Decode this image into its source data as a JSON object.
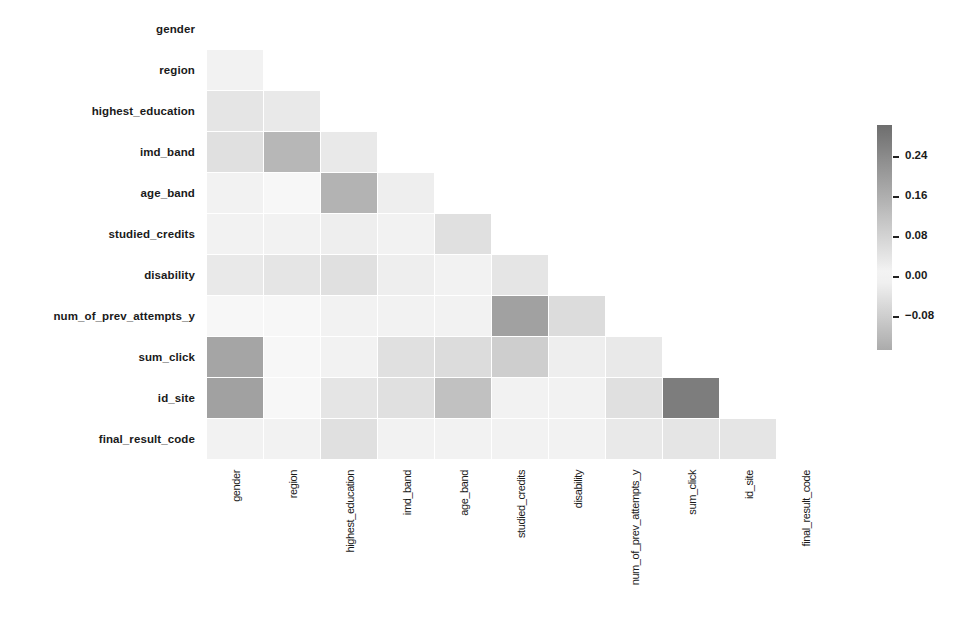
{
  "chart_data": {
    "type": "heatmap",
    "title": "",
    "subtitle": "",
    "variables": [
      "gender",
      "region",
      "highest_education",
      "imd_band",
      "age_band",
      "studied_credits",
      "disability",
      "num_of_prev_attempts_y",
      "sum_click",
      "id_site",
      "final_result_code"
    ],
    "row_labels": [
      "gender",
      "region",
      "highest_education",
      "imd_band",
      "age_band",
      "studied_credits",
      "disability",
      "num_of_prev_attempts_y",
      "sum_click",
      "id_site",
      "final_result_code"
    ],
    "col_labels": [
      "gender",
      "region",
      "highest_education",
      "imd_band",
      "age_band",
      "studied_credits",
      "disability",
      "num_of_prev_attempts_y",
      "sum_click",
      "id_site",
      "final_result_code"
    ],
    "mask": "upper triangle including diagonal hidden",
    "values": [
      [
        null,
        null,
        null,
        null,
        null,
        null,
        null,
        null,
        null,
        null,
        null
      ],
      [
        0.01,
        null,
        null,
        null,
        null,
        null,
        null,
        null,
        null,
        null,
        null
      ],
      [
        0.04,
        0.03,
        null,
        null,
        null,
        null,
        null,
        null,
        null,
        null,
        null
      ],
      [
        0.05,
        0.14,
        0.03,
        null,
        null,
        null,
        null,
        null,
        null,
        null,
        null
      ],
      [
        0.01,
        0.0,
        0.15,
        0.02,
        null,
        null,
        null,
        null,
        null,
        null,
        null
      ],
      [
        0.01,
        0.01,
        0.02,
        0.01,
        0.05,
        null,
        null,
        null,
        null,
        null,
        null
      ],
      [
        0.03,
        0.04,
        0.05,
        0.02,
        0.01,
        0.04,
        null,
        null,
        null,
        null,
        null
      ],
      [
        0.0,
        0.0,
        0.01,
        0.01,
        0.01,
        0.19,
        0.06,
        null,
        null,
        null,
        null
      ],
      [
        0.18,
        0.0,
        0.01,
        0.05,
        0.06,
        0.09,
        0.02,
        0.03,
        null,
        null,
        null
      ],
      [
        0.19,
        0.0,
        0.04,
        0.05,
        0.12,
        0.01,
        0.01,
        0.05,
        0.27,
        null,
        null
      ],
      [
        0.01,
        0.01,
        0.05,
        0.01,
        0.01,
        0.01,
        0.01,
        0.03,
        0.04,
        0.04,
        null
      ]
    ],
    "colorbar": {
      "ticks": [
        0.24,
        0.16,
        0.08,
        0.0,
        -0.08
      ],
      "tick_labels": [
        "0.24",
        "0.16",
        "0.08",
        "0.00",
        "−0.08"
      ],
      "range": [
        -0.148,
        0.302
      ],
      "colors": {
        "high": "#6e6e6e",
        "zero": "#f7f7f7",
        "low": "#ababab"
      },
      "position": "right"
    },
    "xlabel": "",
    "ylabel": "",
    "grid": false,
    "legend_position": "right"
  }
}
